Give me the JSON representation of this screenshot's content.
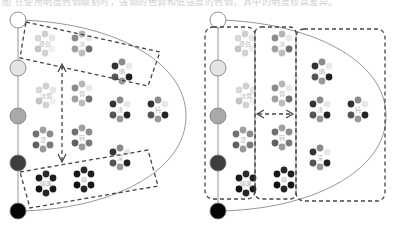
{
  "caption": "图 在使用明度色调级别时，强调的色调和低强度的色调，其中的明度较高差异。",
  "colors": {
    "outline": "#8a8a8a",
    "dashed": "#444444",
    "scale": [
      "#ffffff",
      "#e4e4e4",
      "#a9a9a9",
      "#3e3e3e",
      "#050505"
    ],
    "dot_tones": {
      "pale": [
        "#d9d9d9",
        "#cfcfcf",
        "#e6e6e6",
        "#c4c4c4",
        "#d2d2d2",
        "#f0f0f0"
      ],
      "light": [
        "#8a8a8a",
        "#b5b5b5",
        "#e8e8e8",
        "#a0a0a0",
        "#bdbdbd",
        "#707070"
      ],
      "mid": [
        "#707070",
        "#a0a0a0",
        "#8c8c8c",
        "#606060",
        "#9a9a9a",
        "#7a7a7a"
      ],
      "dark": [
        "#1a1a1a",
        "#2a2a2a",
        "#202020",
        "#101010",
        "#262626",
        "#181818"
      ],
      "mixed": [
        "#333333",
        "#8a8a8a",
        "#e8e8e8",
        "#555555",
        "#999999",
        "#222222"
      ]
    }
  },
  "panels": [
    {
      "name": "left-panel",
      "clusters": [
        {
          "label": "苍白",
          "tone": "pale"
        },
        {
          "label": "淡",
          "tone": "light"
        },
        {
          "label": "明",
          "tone": "mixed"
        },
        {
          "label": "淡弱",
          "tone": "pale"
        },
        {
          "label": "弱",
          "tone": "light"
        },
        {
          "label": "浅",
          "tone": "mixed"
        },
        {
          "label": "钝",
          "tone": "mixed"
        },
        {
          "label": "涩",
          "tone": "mid"
        },
        {
          "label": "钝",
          "tone": "mid"
        },
        {
          "label": "深",
          "tone": "mixed"
        },
        {
          "label": "暗黑",
          "tone": "dark"
        },
        {
          "label": "暗",
          "tone": "dark"
        }
      ]
    },
    {
      "name": "right-panel",
      "clusters": [
        {
          "label": "苍白",
          "tone": "pale"
        },
        {
          "label": "淡",
          "tone": "light"
        },
        {
          "label": "明",
          "tone": "mixed"
        },
        {
          "label": "淡弱",
          "tone": "pale"
        },
        {
          "label": "弱",
          "tone": "light"
        },
        {
          "label": "浅",
          "tone": "mixed"
        },
        {
          "label": "钝",
          "tone": "mixed"
        },
        {
          "label": "涩",
          "tone": "mid"
        },
        {
          "label": "钝",
          "tone": "mid"
        },
        {
          "label": "深",
          "tone": "mixed"
        },
        {
          "label": "暗黑",
          "tone": "dark"
        },
        {
          "label": "暗",
          "tone": "dark"
        }
      ]
    }
  ]
}
